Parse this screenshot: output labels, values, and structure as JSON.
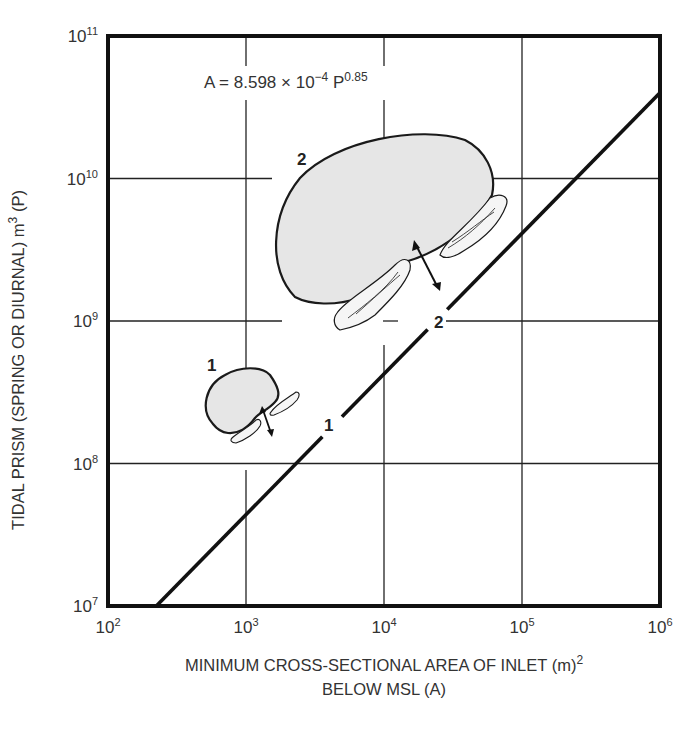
{
  "chart_data": {
    "type": "line",
    "title": "",
    "annotation_formula": {
      "lhs": "A = 8.598 × 10",
      "exp1": "−4",
      "mid": " P",
      "exp2": "0.85"
    },
    "xlabel": {
      "line1_main": "MINIMUM CROSS-SECTIONAL AREA OF INLET (m)",
      "line1_sup": "2",
      "line2": "BELOW MSL (A)"
    },
    "ylabel": {
      "main1": "TIDAL PRISM (SPRING OR DIURNAL) m",
      "sup": "3",
      "main2": " (P)"
    },
    "xscale": "log",
    "yscale": "log",
    "xlim": [
      100,
      1000000
    ],
    "ylim": [
      10000000,
      100000000000
    ],
    "grid": true,
    "x_ticks": [
      {
        "base": "10",
        "exp": "2",
        "value": 100
      },
      {
        "base": "10",
        "exp": "3",
        "value": 1000
      },
      {
        "base": "10",
        "exp": "4",
        "value": 10000
      },
      {
        "base": "10",
        "exp": "5",
        "value": 100000
      },
      {
        "base": "10",
        "exp": "6",
        "value": 1000000
      }
    ],
    "y_ticks": [
      {
        "base": "10",
        "exp": "7",
        "value": 10000000
      },
      {
        "base": "10",
        "exp": "8",
        "value": 100000000
      },
      {
        "base": "10",
        "exp": "9",
        "value": 1000000000
      },
      {
        "base": "10",
        "exp": "10",
        "value": 10000000000
      },
      {
        "base": "10",
        "exp": "11",
        "value": 100000000000
      }
    ],
    "series": [
      {
        "name": "A = 8.598 × 10^-4 P^0.85",
        "x": [
          224,
          1000000
        ],
        "y": [
          10000000,
          40000000000
        ],
        "gap_labels": [
          {
            "text": "1",
            "x": 4000,
            "y": 190000000
          },
          {
            "text": "2",
            "x": 25000,
            "y": 1000000000
          }
        ]
      }
    ],
    "regions": [
      {
        "label": "1",
        "description": "small inlet schematic",
        "center_x": 1000,
        "center_y": 280000000
      },
      {
        "label": "2",
        "description": "large inlet schematic",
        "center_x": 14000,
        "center_y": 5000000000
      }
    ]
  }
}
